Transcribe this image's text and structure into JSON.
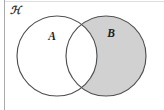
{
  "figure": {
    "name": "venn-diagram-two-sets",
    "shaded_region_meaning": "B minus A",
    "background_color": "#ffffff",
    "canvas": {
      "width": 164,
      "height": 110
    }
  },
  "universe": {
    "label": "ℋ",
    "label_glyph": "U",
    "label_x": 15,
    "label_y": 11,
    "frame_color": "#a8aaad"
  },
  "sets": [
    {
      "id": "A",
      "label": "A",
      "label_x": 52,
      "label_y": 37,
      "cx": 57,
      "cy": 56,
      "r": 40,
      "fill": "#ffffff",
      "stroke": "#4f5053",
      "shaded": false
    },
    {
      "id": "B",
      "label": "B",
      "label_x": 111,
      "label_y": 34,
      "cx": 106,
      "cy": 56,
      "r": 40,
      "fill": "#d1d1d1",
      "stroke": "#4f5053",
      "shaded": true
    }
  ],
  "regions": {
    "intersection_fill": "#ffffff",
    "shade_fill": "#d1d1d1",
    "outside_fill": "#ffffff"
  },
  "colors": {
    "shade_gray": "#d1d1d1",
    "outline_gray": "#4f5053",
    "frame_gray": "#a8aaad",
    "text_black": "#1d1d1f"
  }
}
